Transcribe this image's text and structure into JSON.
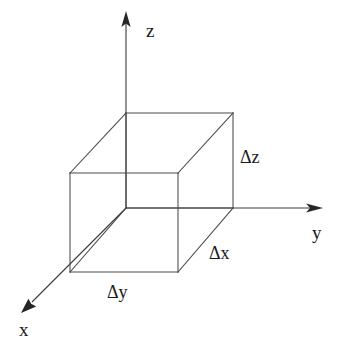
{
  "diagram": {
    "background_color": "#ffffff",
    "line_color": "#4a4a4a",
    "text_color": "#1a1a1a",
    "axes": [
      {
        "id": "x-axis",
        "label": "x",
        "icon": "arrow-head-icon",
        "label_x": 19,
        "label_y": 336,
        "origin": [
          126,
          208
        ],
        "tip": [
          22,
          312
        ]
      },
      {
        "id": "y-axis",
        "label": "y",
        "icon": "arrow-head-icon",
        "label_x": 312,
        "label_y": 239,
        "origin": [
          126,
          208
        ],
        "tip": [
          322,
          208
        ]
      },
      {
        "id": "z-axis",
        "label": "z",
        "icon": "arrow-head-icon",
        "label_x": 146,
        "label_y": 37,
        "origin": [
          126,
          208
        ],
        "tip": [
          126,
          12
        ]
      }
    ],
    "dimension_labels": [
      {
        "id": "delta-z-label",
        "text": "Δz",
        "x": 240,
        "y": 163
      },
      {
        "id": "delta-x-label",
        "text": "Δx",
        "x": 209,
        "y": 259
      },
      {
        "id": "delta-y-label",
        "text": "Δy",
        "x": 107,
        "y": 298
      }
    ],
    "cube": {
      "name": "volume-element-cube",
      "vertices": {
        "back_top_left": [
          126,
          113
        ],
        "back_top_right": [
          233,
          113
        ],
        "front_top_left": [
          70,
          173
        ],
        "front_top_right": [
          178,
          173
        ],
        "back_bottom_left": [
          126,
          208
        ],
        "back_bottom_right": [
          233,
          208
        ],
        "front_bottom_left": [
          70,
          272
        ],
        "front_bottom_right": [
          178,
          272
        ]
      },
      "edges": [
        [
          "front_top_left",
          "front_top_right"
        ],
        [
          "front_top_right",
          "front_bottom_right"
        ],
        [
          "front_bottom_right",
          "front_bottom_left"
        ],
        [
          "front_bottom_left",
          "front_top_left"
        ],
        [
          "back_top_left",
          "back_top_right"
        ],
        [
          "back_top_right",
          "back_bottom_right"
        ],
        [
          "back_bottom_right",
          "back_bottom_left"
        ],
        [
          "back_bottom_left",
          "back_top_left"
        ],
        [
          "front_top_left",
          "back_top_left"
        ],
        [
          "front_top_right",
          "back_top_right"
        ],
        [
          "front_bottom_right",
          "back_bottom_right"
        ],
        [
          "front_bottom_left",
          "back_bottom_left"
        ]
      ]
    }
  }
}
